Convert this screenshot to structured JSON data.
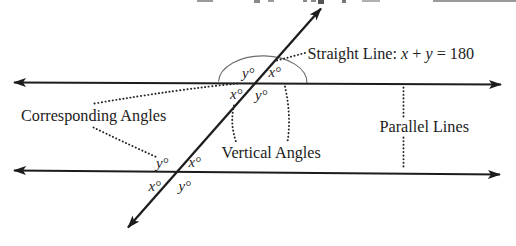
{
  "diagram": {
    "labels": {
      "straight_line_prefix": "Straight Line: ",
      "var_x": "x",
      "plus": " + ",
      "var_y": "y",
      "equals_180": " = 180",
      "corresponding_angles": "Corresponding Angles",
      "vertical_angles": "Vertical Angles",
      "parallel_lines": "Parallel Lines"
    },
    "angle_labels": {
      "top_above_left": "y°",
      "top_above_right": "x°",
      "top_below_left": "x°",
      "top_below_right": "y°",
      "bottom_above_left": "y°",
      "bottom_above_right": "x°",
      "bottom_below_left": "x°",
      "bottom_below_right": "y°"
    },
    "colors": {
      "ink": "#1d1d1d",
      "arc_stroke": "#6e6e6e",
      "background": "#ffffff"
    }
  }
}
